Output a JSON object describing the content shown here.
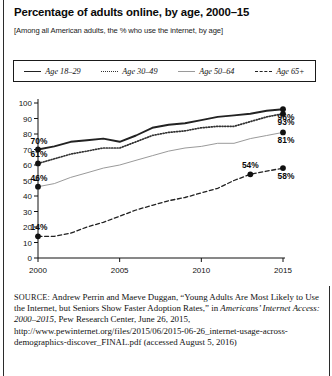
{
  "title": "Percentage of adults online, by age, 2000–15",
  "subtitle": "[Among all American adults, the % who use the internet, by age]",
  "legend": [
    {
      "label": "Age 18–29",
      "style": "solid"
    },
    {
      "label": "Age 30–49",
      "style": "dotted"
    },
    {
      "label": "Age 50–64",
      "style": "thin-solid"
    },
    {
      "label": "Age 65+",
      "style": "dashed"
    }
  ],
  "source": {
    "prefix": "SOURCE:",
    "line1": " Andrew Perrin and Maeve Duggan, “Young Adults Are Most Likely to Use the Internet, but Seniors Show Faster Adoption Rates,” in ",
    "italic": "Americans’ Internet Access: 2000–2015",
    "line2": ", Pew Research Center, June 26, 2015, http://www.pewinternet.org/files/2015/06/2015-06-26_internet-usage-across-demographics-discover_FINAL.pdf (accessed August 5, 2016)"
  },
  "chart_data": {
    "type": "line",
    "title": "Percentage of adults online, by age, 2000–15",
    "subtitle": "[Among all American adults, the % who use the internet, by age]",
    "xlabel": "",
    "ylabel": "",
    "xlim": [
      2000,
      2015
    ],
    "ylim": [
      0,
      100
    ],
    "ytick_labels": [
      "0",
      "10",
      "20",
      "30",
      "40",
      "50",
      "60",
      "70",
      "80",
      "90",
      "100"
    ],
    "yticks": [
      0,
      10,
      20,
      30,
      40,
      50,
      60,
      70,
      80,
      90,
      100
    ],
    "xtick_labels": [
      "2000",
      "2005",
      "2010",
      "2015"
    ],
    "xticks": [
      2000,
      2005,
      2010,
      2015
    ],
    "grid": false,
    "legend_position": "top",
    "x": [
      2000,
      2001,
      2002,
      2003,
      2004,
      2005,
      2006,
      2007,
      2008,
      2009,
      2010,
      2011,
      2012,
      2013,
      2014,
      2015
    ],
    "series": [
      {
        "name": "Age 18–29",
        "style": "solid",
        "color": "#222222",
        "values": [
          70,
          72,
          75,
          76,
          77,
          75,
          79,
          84,
          86,
          87,
          89,
          91,
          92,
          93,
          95,
          96
        ],
        "endpoint_label": "96%",
        "start_label": "70%"
      },
      {
        "name": "Age 30–49",
        "style": "dotted",
        "color": "#333333",
        "values": [
          61,
          64,
          67,
          69,
          71,
          71,
          75,
          79,
          81,
          82,
          84,
          85,
          85,
          88,
          91,
          93
        ],
        "endpoint_label": "93%",
        "start_label": "61%"
      },
      {
        "name": "Age 50–64",
        "style": "thin-solid",
        "color": "#9a9a9a",
        "values": [
          46,
          48,
          52,
          55,
          58,
          60,
          63,
          66,
          69,
          71,
          72,
          74,
          74,
          77,
          79,
          81
        ],
        "endpoint_label": "81%",
        "start_label": "46%"
      },
      {
        "name": "Age 65+",
        "style": "dashed",
        "color": "#222222",
        "values": [
          14,
          14,
          16,
          20,
          23,
          27,
          31,
          34,
          37,
          39,
          42,
          45,
          50,
          54,
          56,
          58
        ],
        "endpoint_label": "58%",
        "start_label": "14%",
        "annotations": [
          {
            "x": 2013,
            "y": 54,
            "label": "54%"
          }
        ]
      }
    ]
  }
}
